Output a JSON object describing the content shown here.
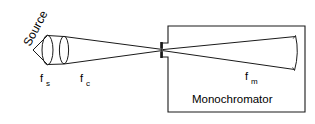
{
  "figure": {
    "width": 315,
    "height": 124,
    "background_color": "#ffffff",
    "ink_color": "#1a1a1a",
    "type": "optical-ray-diagram",
    "caption_text": ""
  },
  "labels": {
    "source": "Source",
    "lens_source_base": "f",
    "lens_source_sub": "s",
    "lens_condenser_base": "f",
    "lens_condenser_sub": "c",
    "mirror_base": "f",
    "mirror_sub": "m",
    "monochromator": "Monochromator"
  },
  "components": {
    "source_point": {
      "name": "source-point",
      "x": 33,
      "y": 50
    },
    "lens_fs": {
      "name": "source-lens",
      "cx": 47,
      "cy": 50,
      "rx": 5.5,
      "ry": 15
    },
    "lens_fc": {
      "name": "condenser-lens",
      "cx": 64,
      "cy": 50,
      "rx": 4.5,
      "ry": 13
    },
    "entrance_slit": {
      "name": "entrance-slit",
      "x": 162,
      "y": 50
    },
    "monochromator_box": {
      "name": "monochromator-box",
      "x": 168,
      "y": 26,
      "w": 137,
      "h": 86
    },
    "focusing_mirror": {
      "name": "focusing-mirror",
      "x": 295,
      "y_top": 35,
      "y_bottom": 70
    }
  },
  "colors": {
    "ink": "#1a1a1a",
    "background": "#ffffff",
    "text": "#000000"
  }
}
